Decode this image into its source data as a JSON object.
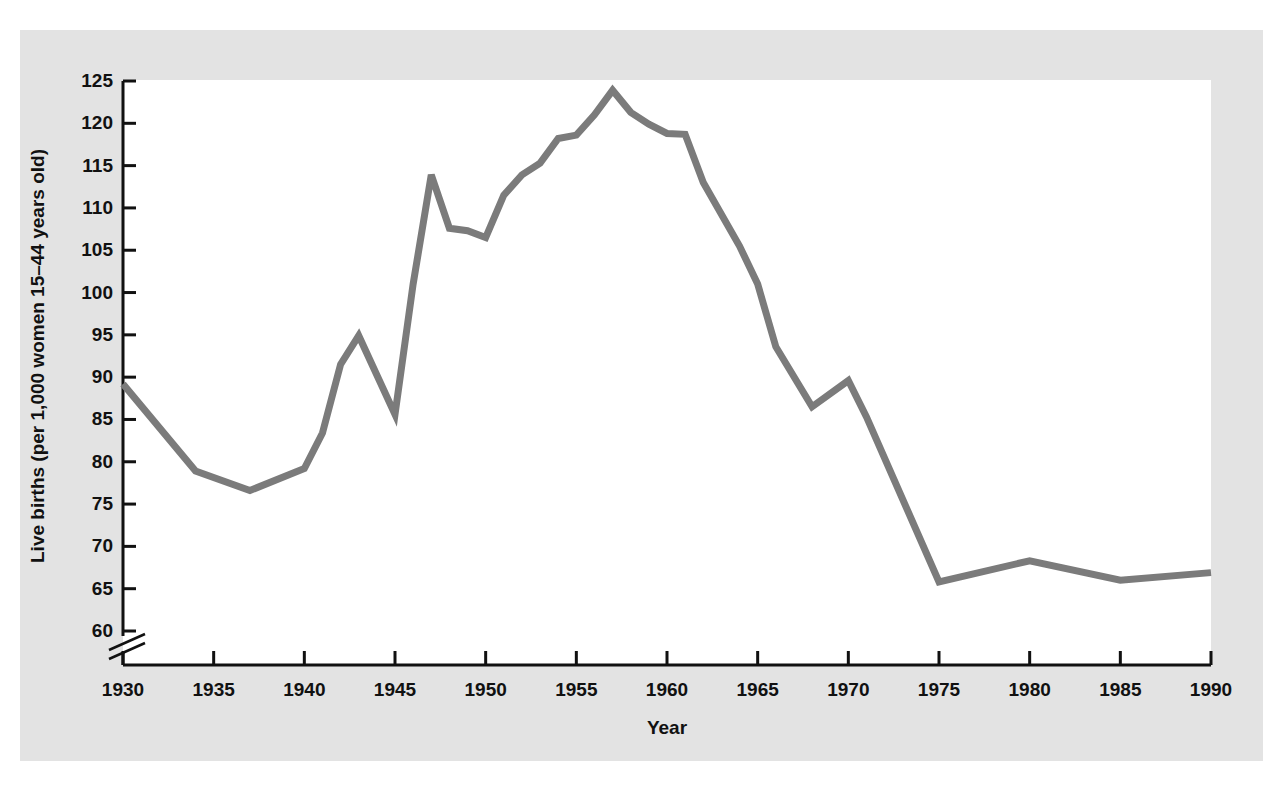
{
  "figure": {
    "panel_background": "#e3e3e3",
    "plot_background": "#ffffff",
    "page_background": "#ffffff",
    "axis_color": "#111111",
    "line_color": "#7b7b7b"
  },
  "chart_data": {
    "type": "line",
    "title": "",
    "subtitle": "",
    "xlabel": "Year",
    "ylabel": "Live births (per 1,000 women 15–44 years old)",
    "xlim": [
      1930,
      1990
    ],
    "ylim": [
      60,
      125
    ],
    "y_axis_break": true,
    "y_axis_break_note": "axis break below 60",
    "grid": false,
    "legend": null,
    "xticks": [
      1930,
      1935,
      1940,
      1945,
      1950,
      1955,
      1960,
      1965,
      1970,
      1975,
      1980,
      1985,
      1990
    ],
    "xtick_labels": [
      "1930",
      "1935",
      "1940",
      "1945",
      "1950",
      "1955",
      "1960",
      "1965",
      "1970",
      "1975",
      "1980",
      "1985",
      "1990"
    ],
    "yticks": [
      60,
      65,
      70,
      75,
      80,
      85,
      90,
      95,
      100,
      105,
      110,
      115,
      120,
      125
    ],
    "ytick_labels": [
      "60",
      "65",
      "70",
      "75",
      "80",
      "85",
      "90",
      "95",
      "100",
      "105",
      "110",
      "115",
      "120",
      "125"
    ],
    "x": [
      1930,
      1934,
      1937,
      1940,
      1941,
      1942,
      1943,
      1945,
      1946,
      1947,
      1948,
      1949,
      1950,
      1951,
      1952,
      1953,
      1954,
      1955,
      1956,
      1957,
      1958,
      1959,
      1960,
      1961,
      1962,
      1964,
      1965,
      1966,
      1968,
      1970,
      1971,
      1975,
      1980,
      1985,
      1990
    ],
    "values": [
      89.2,
      78.9,
      76.6,
      79.2,
      83.4,
      91.5,
      94.9,
      85.6,
      101.0,
      113.9,
      107.6,
      107.3,
      106.5,
      111.5,
      113.9,
      115.3,
      118.2,
      118.6,
      121.0,
      123.9,
      121.3,
      119.9,
      118.8,
      118.7,
      113.0,
      105.5,
      101.0,
      93.6,
      86.5,
      89.6,
      85.3,
      65.8,
      68.3,
      66.0,
      66.9
    ]
  },
  "axis": {
    "y_title": "Live births (per 1,000 women 15–44 years old)",
    "x_title": "Year"
  }
}
